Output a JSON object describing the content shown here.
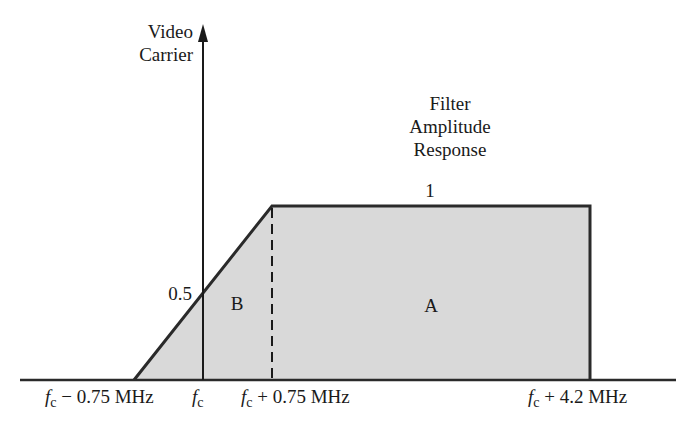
{
  "diagram": {
    "y_axis_label_line1": "Video",
    "y_axis_label_line2": "Carrier",
    "title_line1": "Filter",
    "title_line2": "Amplitude",
    "title_line3": "Response",
    "level_full": "1",
    "level_half": "0.5",
    "region_a": "A",
    "region_b": "B",
    "x_ticks": [
      {
        "var": "f",
        "sub": "c",
        "suffix": " − 0.75 MHz"
      },
      {
        "var": "f",
        "sub": "c",
        "suffix": ""
      },
      {
        "var": "f",
        "sub": "c",
        "suffix": " + 0.75 MHz"
      },
      {
        "var": "f",
        "sub": "c",
        "suffix": " + 4.2 MHz"
      }
    ],
    "colors": {
      "fill": "#d9d9d9",
      "stroke": "#2a2a2a"
    }
  }
}
